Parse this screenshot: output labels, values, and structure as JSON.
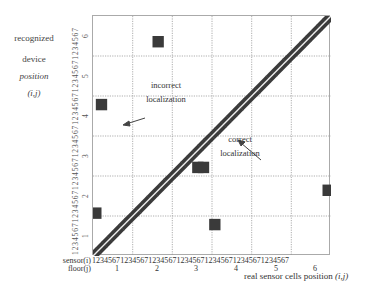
{
  "ylabel": [
    "recognized",
    "device",
    "position",
    "(i,j)"
  ],
  "xlabel": {
    "text": "real sensor cells position ",
    "var": "(i,j)"
  },
  "axis": {
    "sensor_label": "sensor(i)",
    "floor_label": "floor(j)",
    "sensor_ticks": "1234567123456712345671234567123456712345671234567",
    "floors": [
      "1",
      "2",
      "3",
      "4",
      "5",
      "6"
    ]
  },
  "annotations": {
    "incorrect": [
      "incorrect",
      "localization"
    ],
    "correct": [
      "correct",
      "localization"
    ]
  },
  "colors": {
    "cell": "#3a3a3a",
    "diag_line": "#e8e8e8",
    "grid": "#999999"
  },
  "chart_data": {
    "type": "heatmap",
    "title": "",
    "xlabel": "real sensor cells position (i,j)",
    "ylabel": "recognized device position (i,j)",
    "x_groups": [
      "1",
      "2",
      "3",
      "4",
      "5",
      "6"
    ],
    "y_groups": [
      "1",
      "2",
      "3",
      "4",
      "5",
      "6"
    ],
    "sensors_per_group": 7,
    "grid": true,
    "diagonal": "all 42 cells (real == recognized)",
    "off_diagonal_cells": [
      {
        "real_floor": 1,
        "real_sensor": 1,
        "recognized_floor": 2,
        "recognized_sensor": 1
      },
      {
        "real_floor": 1,
        "real_sensor": 2,
        "recognized_floor": 4,
        "recognized_sensor": 6
      },
      {
        "real_floor": 2,
        "real_sensor": 5,
        "recognized_floor": 6,
        "recognized_sensor": 3
      },
      {
        "real_floor": 3,
        "real_sensor": 5,
        "recognized_floor": 3,
        "recognized_sensor": 2
      },
      {
        "real_floor": 3,
        "real_sensor": 6,
        "recognized_floor": 3,
        "recognized_sensor": 2
      },
      {
        "real_floor": 4,
        "real_sensor": 1,
        "recognized_floor": 1,
        "recognized_sensor": 6
      },
      {
        "real_floor": 6,
        "real_sensor": 7,
        "recognized_floor": 2,
        "recognized_sensor": 5
      }
    ],
    "annotations": [
      "incorrect localization",
      "correct localization"
    ]
  }
}
